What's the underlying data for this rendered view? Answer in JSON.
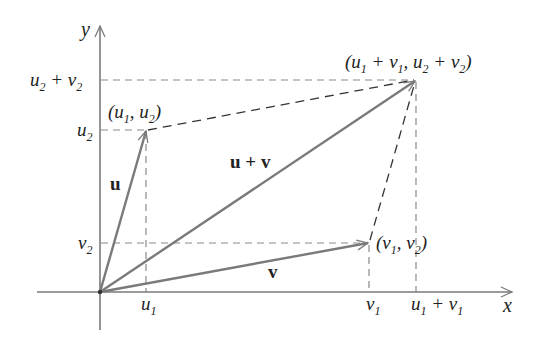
{
  "diagram": {
    "colors": {
      "vector": "#7a7a7a",
      "axis": "#7a7a7a",
      "guide": "#8a8a8a",
      "parallelogram": "#333333",
      "text": "#222222"
    },
    "axes": {
      "x_label": "x",
      "y_label": "y"
    },
    "vectors": [
      {
        "name": "u",
        "label": "u",
        "from": "origin",
        "to": "(u1, u2)"
      },
      {
        "name": "v",
        "label": "v",
        "from": "origin",
        "to": "(v1, v2)"
      },
      {
        "name": "u_plus_v",
        "label": "u + v",
        "from": "origin",
        "to": "(u1 + v1, u2 + v2)"
      }
    ],
    "points": {
      "u_tip": {
        "label_main": "(u",
        "s1": "1",
        "mid": ", u",
        "s2": "2",
        "end": ")"
      },
      "v_tip": {
        "label_main": "(v",
        "s1": "1",
        "mid": ", v",
        "s2": "2",
        "end": ")"
      },
      "sum_tip": {
        "a": "(u",
        "a_s": "1",
        "b": " + v",
        "b_s": "1",
        "c": ", u",
        "c_s": "2",
        "d": " + v",
        "d_s": "2",
        "e": ")"
      }
    },
    "ticks": {
      "x": [
        {
          "id": "u1",
          "base": "u",
          "sub": "1"
        },
        {
          "id": "v1",
          "base": "v",
          "sub": "1"
        },
        {
          "id": "u1_plus_v1",
          "base": "u",
          "sub": "1",
          "plus": " + ",
          "base2": "v",
          "sub2": "1"
        }
      ],
      "y": [
        {
          "id": "v2",
          "base": "v",
          "sub": "2"
        },
        {
          "id": "u2",
          "base": "u",
          "sub": "2"
        },
        {
          "id": "u2_plus_v2",
          "base": "u",
          "sub": "2",
          "plus": " + ",
          "base2": "v",
          "sub2": "2"
        }
      ]
    }
  }
}
